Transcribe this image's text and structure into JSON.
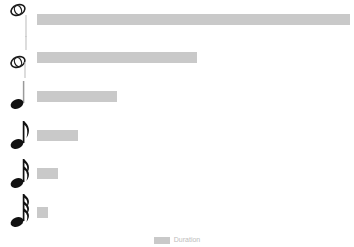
{
  "chart_data": {
    "type": "bar",
    "orientation": "horizontal",
    "title": "",
    "xlabel": "",
    "ylabel": "",
    "grid": false,
    "legend_position": "bottom",
    "bar_color": "#c9c9c9",
    "background_color": "#ffffff",
    "xlim": [
      0,
      4
    ],
    "categories": [
      "whole-note",
      "half-note",
      "quarter-note",
      "eighth-note",
      "sixteenth-note",
      "thirty-second-note"
    ],
    "category_glyphs": [
      "whole note",
      "half note",
      "quarter note",
      "eighth note",
      "sixteenth note",
      "thirty-second note"
    ],
    "values": [
      4,
      2,
      1,
      0.5,
      0.25,
      0.125
    ],
    "bar_pixel_lengths": [
      313,
      160,
      80,
      41,
      21,
      11
    ],
    "series": [
      {
        "name": "Duration",
        "values": [
          4,
          2,
          1,
          0.5,
          0.25,
          0.125
        ]
      }
    ]
  },
  "legend": {
    "swatch_color": "#c9c9c9",
    "label": "Duration"
  },
  "rows": [
    {
      "note": "whole-note",
      "value": 4,
      "bar_px": 313
    },
    {
      "note": "half-note",
      "value": 2,
      "bar_px": 160
    },
    {
      "note": "quarter-note",
      "value": 1,
      "bar_px": 80
    },
    {
      "note": "eighth-note",
      "value": 0.5,
      "bar_px": 41
    },
    {
      "note": "sixteenth-note",
      "value": 0.25,
      "bar_px": 21
    },
    {
      "note": "thirty-second-note",
      "value": 0.125,
      "bar_px": 11
    }
  ]
}
